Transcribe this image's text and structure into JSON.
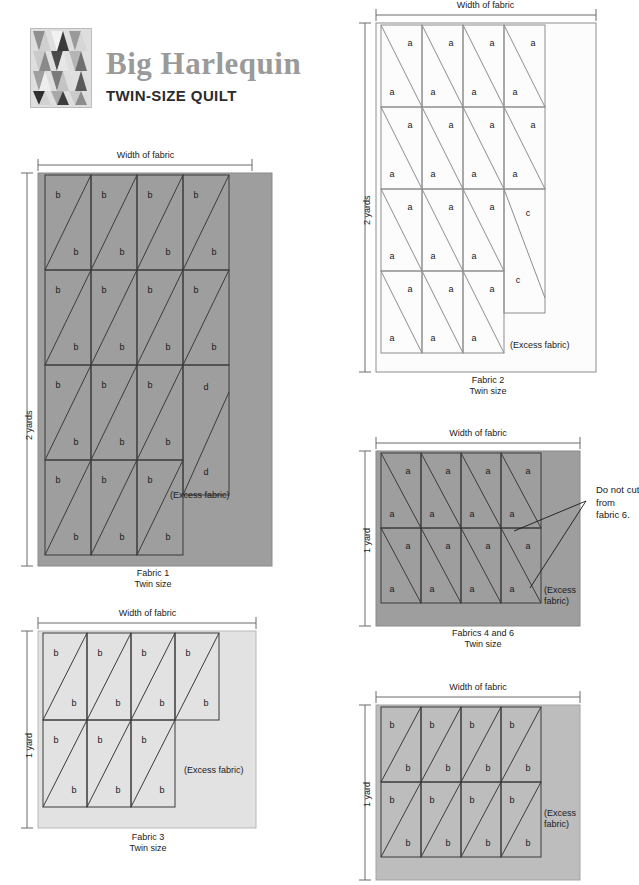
{
  "header": {
    "title": "Big Harlequin",
    "subtitle": "TWIN-SIZE QUILT",
    "logo_alt": "harlequin-quilt-thumbnail"
  },
  "common": {
    "width_of_fabric": "Width of fabric",
    "excess_fabric": "(Excess fabric)",
    "excess_fabric_wrapped": "(Excess\nfabric)",
    "twin_size": "Twin size",
    "piece_a": "a",
    "piece_b": "b",
    "piece_c": "c",
    "piece_d": "d"
  },
  "colors": {
    "fabric1_fill": "#9e9e9e",
    "fabric2_fill": "#fcfcfc",
    "fabric3_fill": "#e2e2e2",
    "fabric46_fill": "#9e9e9e",
    "fabric5_fill": "#bdbdbd",
    "cut_line": "#3b3b3b",
    "cut_line_light": "#8d8d8d",
    "measure_line": "#6b6b6b",
    "title_gray": "#9a9a9a",
    "text": "#1a1a1a"
  },
  "diagrams": [
    {
      "id": "fabric-1",
      "caption_line1": "Fabric 1",
      "caption_line2": "Twin size",
      "height_label": "2 yards",
      "width_label": "Width of fabric",
      "excess_label": "(Excess fabric)",
      "fill": "#9e9e9e",
      "diagonal_direction": "bottom-left-to-top-right",
      "rows": 4,
      "cols_per_row": [
        4,
        4,
        3,
        3
      ],
      "piece_letter": "b",
      "pieces_per_cell": 2,
      "extra_block": {
        "letter": "d",
        "count": 2,
        "position": "right-of-row-3"
      }
    },
    {
      "id": "fabric-2",
      "caption_line1": "Fabric 2",
      "caption_line2": "Twin size",
      "height_label": "2 yards",
      "width_label": "Width of fabric",
      "excess_label": "(Excess fabric)",
      "fill": "#fcfcfc",
      "diagonal_direction": "top-left-to-bottom-right",
      "rows": 4,
      "cols_per_row": [
        4,
        4,
        3,
        3
      ],
      "piece_letter": "a",
      "pieces_per_cell": 2,
      "extra_block": {
        "letter": "c",
        "count": 2,
        "position": "right-of-rows-3-4"
      }
    },
    {
      "id": "fabric-3",
      "caption_line1": "Fabric 3",
      "caption_line2": "Twin size",
      "height_label": "1 yard",
      "width_label": "Width of fabric",
      "excess_label": "(Excess fabric)",
      "fill": "#e2e2e2",
      "diagonal_direction": "bottom-left-to-top-right",
      "rows": 2,
      "cols_per_row": [
        4,
        3
      ],
      "piece_letter": "b",
      "pieces_per_cell": 2
    },
    {
      "id": "fabric-4-and-6",
      "caption_line1": "Fabrics 4 and 6",
      "caption_line2": "Twin size",
      "height_label": "1 yard",
      "width_label": "Width of fabric",
      "excess_label": "(Excess\nfabric)",
      "fill": "#9e9e9e",
      "diagonal_direction": "top-left-to-bottom-right",
      "rows": 2,
      "cols_per_row": [
        4,
        4
      ],
      "piece_letter": "a",
      "pieces_per_cell": 2,
      "annotation": "Do not cut\nfrom\nfabric 6.",
      "annotation_leaders": 2
    },
    {
      "id": "fabric-5",
      "caption_line1": "",
      "caption_line2": "",
      "height_label": "1 yard",
      "width_label": "Width of fabric",
      "excess_label": "(Excess\nfabric)",
      "fill": "#bdbdbd",
      "diagonal_direction": "bottom-left-to-top-right",
      "rows": 2,
      "cols_per_row": [
        4,
        4
      ],
      "piece_letter": "b",
      "pieces_per_cell": 2
    }
  ]
}
